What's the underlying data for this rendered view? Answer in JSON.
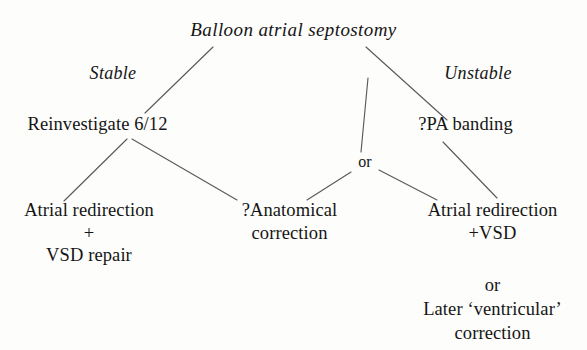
{
  "diagram": {
    "title": "Balloon atrial septostomy",
    "type": "clinical-decision-tree",
    "background_color": "#fdfdfb",
    "ink_color": "#151515",
    "line_color": "#5a5a5a",
    "nodes": {
      "root": "Balloon atrial septostomy",
      "label_stable": "Stable",
      "label_unstable": "Unstable",
      "reinvestigate": "Reinvestigate 6/12",
      "pa_banding": "?PA banding",
      "or_connector": "or",
      "atrial_redirection_vsd_repair": "Atrial redirection\n+\nVSD repair",
      "anatomical_correction": "?Anatomical\ncorrection",
      "atrial_redirection_plus_vsd": "Atrial redirection\n+VSD",
      "later_ventricular": "or\nLater ‘ventricular’\ncorrection"
    }
  }
}
